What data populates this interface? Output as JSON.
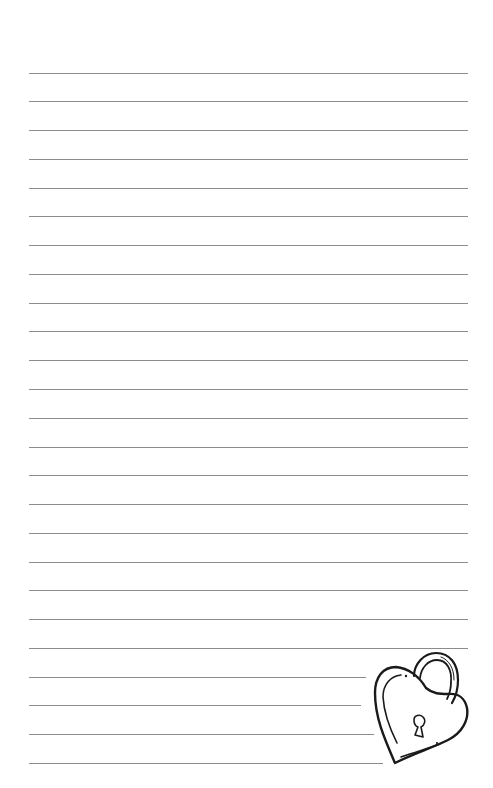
{
  "paper": {
    "background": "#ffffff",
    "line_color": "#8c8c8c",
    "line_count": 25,
    "line_start_x": 29,
    "line_end_x": 468,
    "first_line_y": 72.5,
    "line_spacing": 28.77,
    "short_line_ends": {
      "22": 366,
      "23": 361,
      "24": 374,
      "25": 383
    }
  },
  "decoration": {
    "icon": "heart-padlock-icon",
    "stroke_color": "#1a1a1a"
  }
}
